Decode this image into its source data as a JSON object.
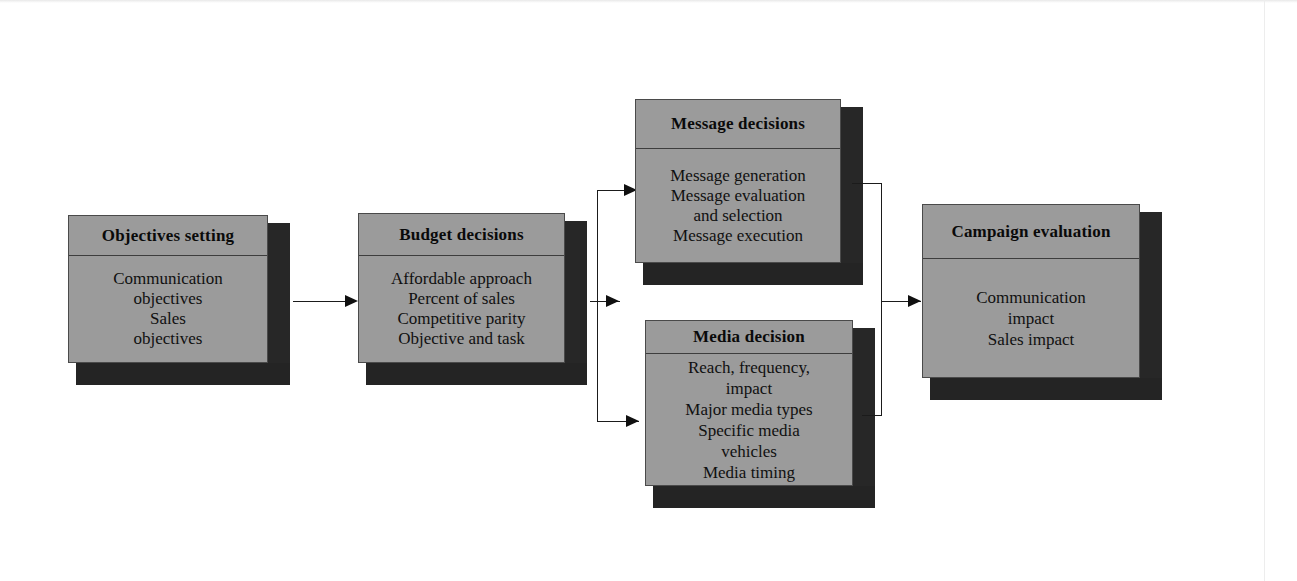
{
  "diagram": {
    "boxes": [
      {
        "id": "objectives-setting",
        "title": "Objectives setting",
        "lines": [
          "Communication",
          "objectives",
          "Sales",
          "objectives"
        ]
      },
      {
        "id": "budget-decisions",
        "title": "Budget decisions",
        "lines": [
          "Affordable approach",
          "Percent of sales",
          "Competitive parity",
          "Objective and task"
        ]
      },
      {
        "id": "message-decisions",
        "title": "Message decisions",
        "lines": [
          "Message generation",
          "Message evaluation",
          "and selection",
          "Message execution"
        ]
      },
      {
        "id": "media-decision",
        "title": "Media decision",
        "lines": [
          "Reach, frequency,",
          "impact",
          "Major media types",
          "Specific media",
          "vehicles",
          "Media timing"
        ]
      },
      {
        "id": "campaign-evaluation",
        "title": "Campaign evaluation",
        "lines": [
          "Communication",
          "impact",
          "Sales impact"
        ]
      }
    ],
    "colors": {
      "box_fill": "#9b9b9b",
      "box_shadow": "#272727",
      "box_border": "#4a4a4a",
      "connector": "#1b1b1b",
      "text": "#101010",
      "background": "#ffffff"
    }
  }
}
